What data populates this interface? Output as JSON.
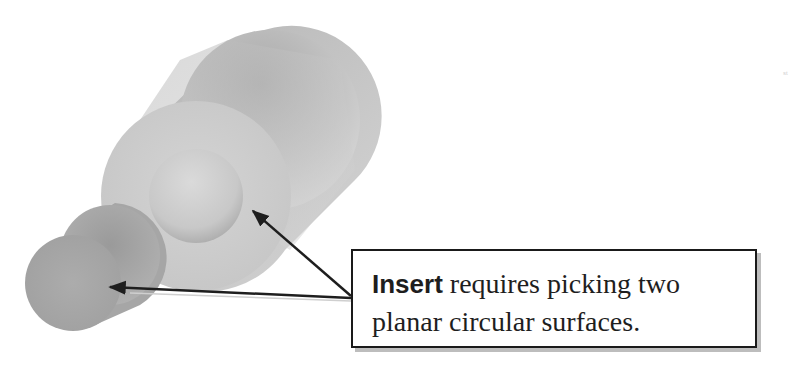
{
  "callout": {
    "keyword": "Insert",
    "line1_rest": " requires picking two",
    "line2": "planar circular surfaces."
  },
  "corner_mark": "st",
  "figure": {
    "objects": [
      {
        "name": "large-hollow-cylinder",
        "description": "Large cylinder with a circular hole on its front planar face"
      },
      {
        "name": "small-cylinder",
        "description": "Small solid cylinder at lower left"
      }
    ],
    "arrows": [
      {
        "from": "callout",
        "to": "inner-hole-circular-face"
      },
      {
        "from": "callout",
        "to": "small-cylinder-circular-face"
      }
    ],
    "colors": {
      "background": "#ffffff",
      "cylinder_light": "#d8d8d8",
      "cylinder_mid": "#bdbdbd",
      "cylinder_dark": "#9a9a9a",
      "arrow": "#1e1e1e",
      "box_border": "#1a1a1a"
    }
  }
}
